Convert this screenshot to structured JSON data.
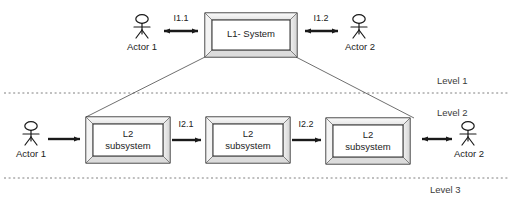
{
  "diagram": {
    "type": "block-diagram",
    "background_color": "#ffffff",
    "stroke_color": "#1a1a1a",
    "box_fill_color": "#ffffff",
    "box_bevel_color": "#e8e8e8",
    "divider_color": "#777777"
  },
  "level1": {
    "system_box": {
      "label": "L1- System"
    },
    "left_actor": {
      "label": "Actor 1"
    },
    "right_actor": {
      "label": "Actor 2"
    },
    "left_interface": {
      "label": "I1.1",
      "direction": "bidirectional"
    },
    "right_interface": {
      "label": "I1.2",
      "direction": "bidirectional"
    }
  },
  "level2": {
    "left_actor": {
      "label": "Actor 1"
    },
    "right_actor": {
      "label": "Actor 2"
    },
    "actor_in_interface": {
      "label": "",
      "direction": "right"
    },
    "actor_out_interface": {
      "label": "",
      "direction": "bidirectional"
    },
    "subsystems": [
      {
        "line1": "L2",
        "line2": "subsystem"
      },
      {
        "line1": "L2",
        "line2": "subsystem"
      },
      {
        "line1": "L2",
        "line2": "subsystem"
      }
    ],
    "interfaces": [
      {
        "label": "I2.1",
        "direction": "right"
      },
      {
        "label": "I2.2",
        "direction": "right"
      }
    ]
  },
  "level_dividers": [
    {
      "label": "Level 1"
    },
    {
      "label": "Level 2"
    },
    {
      "label": "Level 3"
    }
  ]
}
